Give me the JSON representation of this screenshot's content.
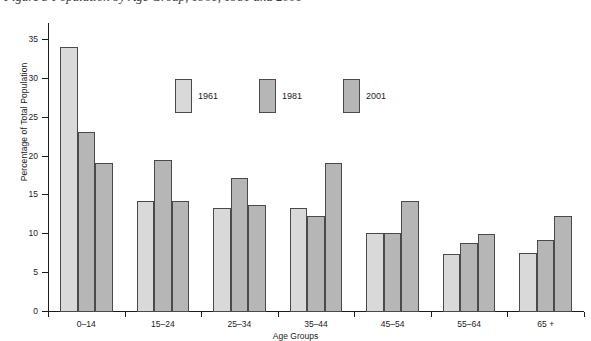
{
  "figure": {
    "caption_cut_off": "Figure 3  Population by Age Group, 1961, 1981 and 2001"
  },
  "chart_data": {
    "type": "bar",
    "title": "",
    "xlabel": "Age Groups",
    "ylabel": "Percentage of Total Population",
    "ylim": [
      0,
      35
    ],
    "yticks": [
      0,
      5,
      10,
      15,
      20,
      25,
      30,
      35
    ],
    "ytick_labels": [
      "0",
      "5",
      "10",
      "15",
      "20",
      "25",
      "30",
      "35"
    ],
    "grid": false,
    "legend_position": "inside-upper-center",
    "categories": [
      "0–14",
      "15–24",
      "25–34",
      "35–44",
      "45–54",
      "55–64",
      "65 +"
    ],
    "series": [
      {
        "name": "1961",
        "color": "#d9d9d9",
        "values": [
          34.0,
          14.2,
          13.2,
          13.2,
          10.1,
          7.3,
          7.4
        ]
      },
      {
        "name": "1981",
        "color": "#b6b6b6",
        "values": [
          23.0,
          19.4,
          17.1,
          12.2,
          10.1,
          8.8,
          9.2
        ]
      },
      {
        "name": "2001",
        "color": "#b6b6b6",
        "values": [
          19.1,
          14.2,
          13.6,
          19.1,
          14.2,
          9.9,
          12.2
        ]
      }
    ]
  },
  "style": {
    "bar_edge_color": "#4a4a4a",
    "axis_color": "#1b1b1b",
    "background": "#ffffff"
  }
}
